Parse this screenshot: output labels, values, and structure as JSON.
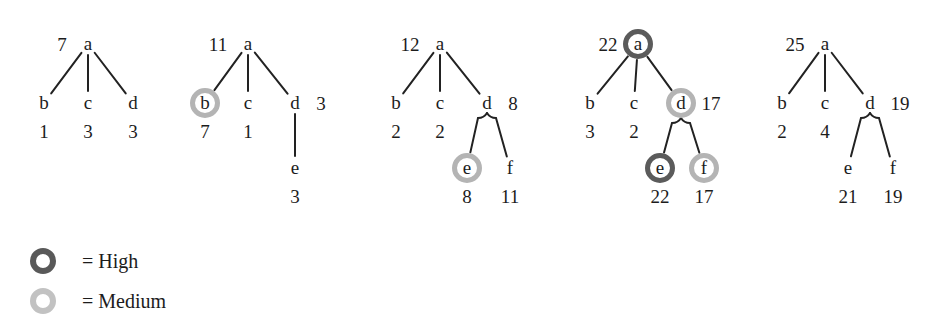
{
  "figure": {
    "kind": "tree-sequence-diagram",
    "tree_count": 5,
    "node_radius": 15
  },
  "trees": [
    {
      "id": "tree-1",
      "nodes": [
        {
          "id": "a",
          "label": "a",
          "value": "7",
          "x": 88,
          "y": 44,
          "highlight": "none",
          "value_pos": "left"
        },
        {
          "id": "b",
          "label": "b",
          "value": "1",
          "x": 44,
          "y": 103,
          "highlight": "none",
          "value_pos": "below"
        },
        {
          "id": "c",
          "label": "c",
          "value": "3",
          "x": 88,
          "y": 103,
          "highlight": "none",
          "value_pos": "below"
        },
        {
          "id": "d",
          "label": "d",
          "value": "3",
          "x": 133,
          "y": 103,
          "highlight": "none",
          "value_pos": "below"
        }
      ],
      "edges": [
        {
          "from": "a",
          "to": "b",
          "style": "straight"
        },
        {
          "from": "a",
          "to": "c",
          "style": "straight"
        },
        {
          "from": "a",
          "to": "d",
          "style": "straight"
        }
      ]
    },
    {
      "id": "tree-2",
      "nodes": [
        {
          "id": "a",
          "label": "a",
          "value": "11",
          "x": 248,
          "y": 44,
          "highlight": "none",
          "value_pos": "left"
        },
        {
          "id": "b",
          "label": "b",
          "value": "7",
          "x": 205,
          "y": 103,
          "highlight": "medium",
          "value_pos": "below"
        },
        {
          "id": "c",
          "label": "c",
          "value": "1",
          "x": 248,
          "y": 103,
          "highlight": "none",
          "value_pos": "below"
        },
        {
          "id": "d",
          "label": "d",
          "value": "3",
          "x": 295,
          "y": 103,
          "highlight": "none",
          "value_pos": "right"
        },
        {
          "id": "e",
          "label": "e",
          "value": "3",
          "x": 295,
          "y": 168,
          "highlight": "none",
          "value_pos": "below"
        }
      ],
      "edges": [
        {
          "from": "a",
          "to": "b",
          "style": "straight"
        },
        {
          "from": "a",
          "to": "c",
          "style": "straight"
        },
        {
          "from": "a",
          "to": "d",
          "style": "straight"
        },
        {
          "from": "d",
          "to": "e",
          "style": "straight"
        }
      ]
    },
    {
      "id": "tree-3",
      "nodes": [
        {
          "id": "a",
          "label": "a",
          "value": "12",
          "x": 440,
          "y": 44,
          "highlight": "none",
          "value_pos": "left"
        },
        {
          "id": "b",
          "label": "b",
          "value": "2",
          "x": 396,
          "y": 103,
          "highlight": "none",
          "value_pos": "below"
        },
        {
          "id": "c",
          "label": "c",
          "value": "2",
          "x": 440,
          "y": 103,
          "highlight": "none",
          "value_pos": "below"
        },
        {
          "id": "d",
          "label": "d",
          "value": "8",
          "x": 487,
          "y": 103,
          "highlight": "none",
          "value_pos": "right"
        },
        {
          "id": "e",
          "label": "e",
          "value": "8",
          "x": 467,
          "y": 168,
          "highlight": "medium",
          "value_pos": "below"
        },
        {
          "id": "f",
          "label": "f",
          "value": "11",
          "x": 510,
          "y": 168,
          "highlight": "none",
          "value_pos": "below"
        }
      ],
      "edges": [
        {
          "from": "a",
          "to": "b",
          "style": "straight"
        },
        {
          "from": "a",
          "to": "c",
          "style": "straight"
        },
        {
          "from": "a",
          "to": "d",
          "style": "straight"
        },
        {
          "from": "d",
          "to": "e",
          "style": "bracket"
        },
        {
          "from": "d",
          "to": "f",
          "style": "bracket"
        }
      ]
    },
    {
      "id": "tree-4",
      "nodes": [
        {
          "id": "a",
          "label": "a",
          "value": "22",
          "x": 638,
          "y": 44,
          "highlight": "high",
          "value_pos": "left"
        },
        {
          "id": "b",
          "label": "b",
          "value": "3",
          "x": 590,
          "y": 103,
          "highlight": "none",
          "value_pos": "below"
        },
        {
          "id": "c",
          "label": "c",
          "value": "2",
          "x": 634,
          "y": 103,
          "highlight": "none",
          "value_pos": "below"
        },
        {
          "id": "d",
          "label": "d",
          "value": "17",
          "x": 681,
          "y": 103,
          "highlight": "medium",
          "value_pos": "right"
        },
        {
          "id": "e",
          "label": "e",
          "value": "22",
          "x": 660,
          "y": 168,
          "highlight": "high",
          "value_pos": "below"
        },
        {
          "id": "f",
          "label": "f",
          "value": "17",
          "x": 704,
          "y": 168,
          "highlight": "medium",
          "value_pos": "below"
        }
      ],
      "edges": [
        {
          "from": "a",
          "to": "b",
          "style": "straight"
        },
        {
          "from": "a",
          "to": "c",
          "style": "straight"
        },
        {
          "from": "a",
          "to": "d",
          "style": "straight"
        },
        {
          "from": "d",
          "to": "e",
          "style": "bracket"
        },
        {
          "from": "d",
          "to": "f",
          "style": "bracket"
        }
      ]
    },
    {
      "id": "tree-5",
      "nodes": [
        {
          "id": "a",
          "label": "a",
          "value": "25",
          "x": 825,
          "y": 44,
          "highlight": "none",
          "value_pos": "left"
        },
        {
          "id": "b",
          "label": "b",
          "value": "2",
          "x": 782,
          "y": 103,
          "highlight": "none",
          "value_pos": "below"
        },
        {
          "id": "c",
          "label": "c",
          "value": "4",
          "x": 825,
          "y": 103,
          "highlight": "none",
          "value_pos": "below"
        },
        {
          "id": "d",
          "label": "d",
          "value": "19",
          "x": 870,
          "y": 103,
          "highlight": "none",
          "value_pos": "right"
        },
        {
          "id": "e",
          "label": "e",
          "value": "21",
          "x": 848,
          "y": 168,
          "highlight": "none",
          "value_pos": "below"
        },
        {
          "id": "f",
          "label": "f",
          "value": "19",
          "x": 893,
          "y": 168,
          "highlight": "none",
          "value_pos": "below"
        }
      ],
      "edges": [
        {
          "from": "a",
          "to": "b",
          "style": "straight"
        },
        {
          "from": "a",
          "to": "c",
          "style": "straight"
        },
        {
          "from": "a",
          "to": "d",
          "style": "straight"
        },
        {
          "from": "d",
          "to": "e",
          "style": "bracket"
        },
        {
          "from": "d",
          "to": "f",
          "style": "bracket"
        }
      ]
    }
  ],
  "legend": {
    "items": [
      {
        "id": "high",
        "ring": "high",
        "label": "= High",
        "x": 30,
        "y": 248
      },
      {
        "id": "medium",
        "ring": "medium",
        "label": "= Medium",
        "x": 30,
        "y": 288
      }
    ]
  },
  "colors": {
    "ink": "#1c1c1c",
    "edge": "#222222",
    "high_ring": "#5b5b5b",
    "medium_ring": "#b4b4b4",
    "background": "#ffffff"
  }
}
